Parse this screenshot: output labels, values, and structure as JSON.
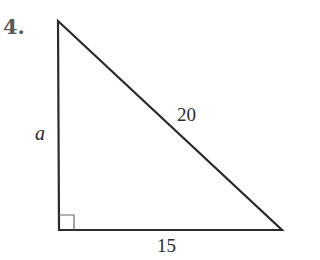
{
  "problem": {
    "number_label": "4."
  },
  "figure": {
    "type": "right-triangle",
    "vertices": {
      "top": [
        58,
        21
      ],
      "right_angle": [
        59,
        230
      ],
      "right": [
        282,
        230
      ]
    },
    "right_angle_marker_size": 15,
    "stroke_color": "#2b2b2b",
    "marker_color": "#666666"
  },
  "labels": {
    "vertical_leg": "a",
    "hypotenuse": "20",
    "base": "15"
  }
}
